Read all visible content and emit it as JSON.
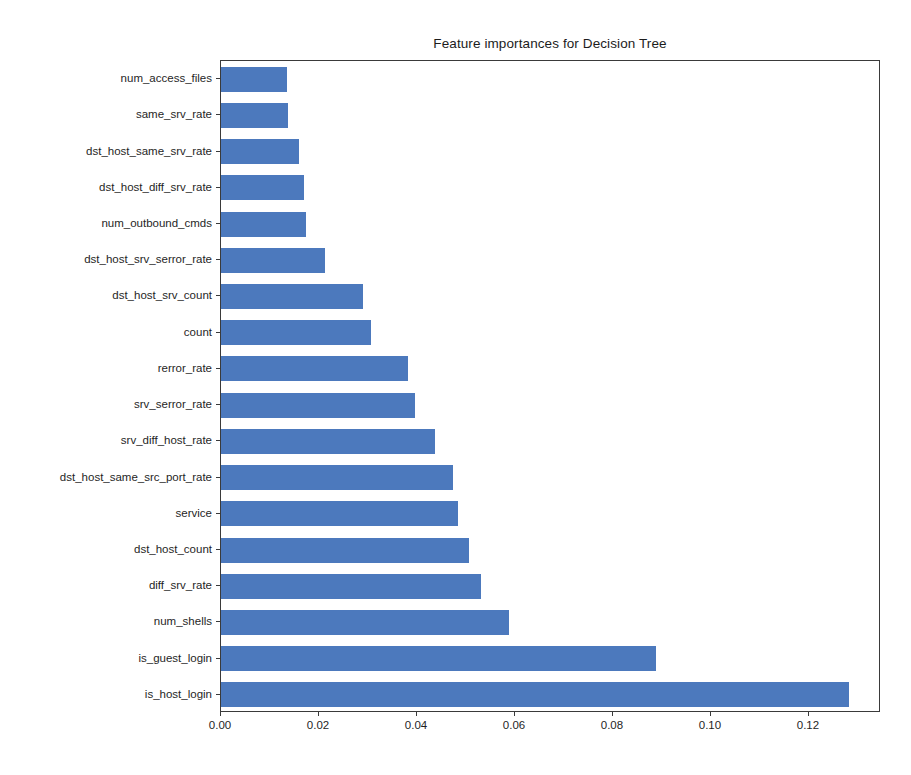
{
  "chart_data": {
    "type": "bar",
    "orientation": "horizontal",
    "title": "Feature importances for Decision Tree",
    "xlabel": "",
    "ylabel": "",
    "xlim": [
      0.0,
      0.1347
    ],
    "grid": false,
    "legend": null,
    "bar_color": "#4c79bd",
    "categories": [
      "num_access_files",
      "same_srv_rate",
      "dst_host_same_srv_rate",
      "dst_host_diff_srv_rate",
      "num_outbound_cmds",
      "dst_host_srv_serror_rate",
      "dst_host_srv_count",
      "count",
      "rerror_rate",
      "srv_serror_rate",
      "srv_diff_host_rate",
      "dst_host_same_src_port_rate",
      "service",
      "dst_host_count",
      "diff_srv_rate",
      "num_shells",
      "is_guest_login",
      "is_host_login"
    ],
    "values": [
      0.0135,
      0.0137,
      0.0159,
      0.0169,
      0.0174,
      0.0212,
      0.029,
      0.0306,
      0.0382,
      0.0396,
      0.0437,
      0.0473,
      0.0484,
      0.0506,
      0.0531,
      0.0588,
      0.0888,
      0.1281
    ],
    "xticks": [
      0.0,
      0.02,
      0.04,
      0.06,
      0.08,
      0.1,
      0.12
    ],
    "xtick_labels": [
      "0.00",
      "0.02",
      "0.04",
      "0.06",
      "0.08",
      "0.10",
      "0.12"
    ]
  }
}
